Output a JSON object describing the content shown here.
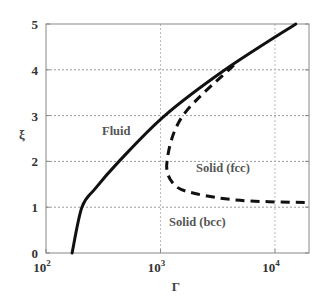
{
  "chart_data": {
    "type": "line",
    "title": "",
    "xlabel": "Γ",
    "ylabel": "ξ",
    "xscale": "log",
    "xlim": [
      100,
      20000
    ],
    "ylim": [
      0,
      5
    ],
    "xticks": [
      "10^2",
      "10^3",
      "10^4"
    ],
    "yticks": [
      "0",
      "1",
      "2",
      "3",
      "4",
      "5"
    ],
    "grid": true,
    "legend": null,
    "series": [
      {
        "name": "Fluid-solid boundary",
        "style": "solid",
        "x": [
          169,
          206,
          268,
          434,
          1090,
          3660,
          15200
        ],
        "y": [
          0,
          1,
          1.4,
          2,
          3,
          4,
          5
        ]
      },
      {
        "name": "bcc-fcc boundary",
        "style": "dashed",
        "x": [
          4370,
          1570,
          1140,
          1310,
          2000,
          4940,
          18400
        ],
        "y": [
          4.1,
          3,
          2,
          1.5,
          1.3,
          1.15,
          1.1
        ]
      }
    ],
    "annotations": [
      {
        "text": "Fluid",
        "x": 330,
        "y": 3.2
      },
      {
        "text": "Solid (fcc)",
        "x": 3000,
        "y": 2.4
      },
      {
        "text": "Solid (bcc)",
        "x": 1500,
        "y": 0.75
      }
    ]
  },
  "labels": {
    "x_axis": "Γ",
    "y_axis": "ξ",
    "x_tick_base": "10",
    "x_tick_exps": [
      "2",
      "3",
      "4"
    ],
    "y_ticks": [
      "0",
      "1",
      "2",
      "3",
      "4",
      "5"
    ],
    "region_fluid": "Fluid",
    "region_fcc": "Solid (fcc)",
    "region_bcc": "Solid (bcc)"
  }
}
